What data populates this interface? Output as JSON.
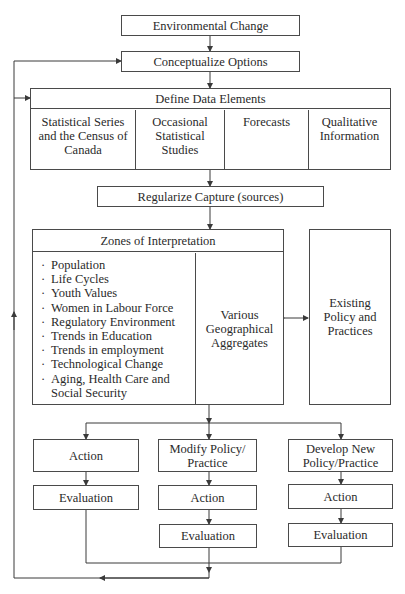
{
  "diagram": {
    "nodes": {
      "environmental_change": "Environmental Change",
      "conceptualize_options": "Conceptualize Options",
      "define_data_elements": {
        "title": "Define Data Elements",
        "columns": [
          "Statistical Series and the Census of Canada",
          "Occasional Statistical Studies",
          "Forecasts",
          "Qualitative Information"
        ]
      },
      "regularize_capture": "Regularize Capture (sources)",
      "zones_of_interpretation": {
        "title": "Zones of Interpretation",
        "items": [
          "Population",
          "Life Cycles",
          "Youth Values",
          "Women in Labour Force",
          "Regulatory Environment",
          "Trends in Education",
          "Trends in employment",
          "Technological Change",
          "Aging, Health Care and Social Security"
        ],
        "aggregates": "Various Geographical Aggregates"
      },
      "existing_policy": "Existing Policy and Practices",
      "branches": [
        {
          "head": "Action",
          "steps": [
            "Evaluation"
          ]
        },
        {
          "head": "Modify Policy/ Practice",
          "steps": [
            "Action",
            "Evaluation"
          ]
        },
        {
          "head": "Develop New Policy/Practice",
          "steps": [
            "Action",
            "Evaluation"
          ]
        }
      ]
    },
    "edges": [
      "Environmental Change -> Conceptualize Options",
      "Conceptualize Options -> Define Data Elements",
      "Define Data Elements -> Regularize Capture (sources)",
      "Regularize Capture (sources) -> Zones of Interpretation",
      "Various Geographical Aggregates <-> Existing Policy and Practices",
      "Zones of Interpretation -> Action",
      "Zones of Interpretation -> Modify Policy/Practice",
      "Zones of Interpretation -> Develop New Policy/Practice",
      "Action -> Evaluation",
      "Modify Policy/Practice -> Action -> Evaluation",
      "Develop New Policy/Practice -> Action -> Evaluation",
      "Evaluations -> feedback -> Conceptualize Options",
      "feedback -> Define Data Elements"
    ],
    "colors": {
      "line": "#3a3a3a",
      "background": "#ffffff",
      "text": "#2a2a2a"
    }
  }
}
